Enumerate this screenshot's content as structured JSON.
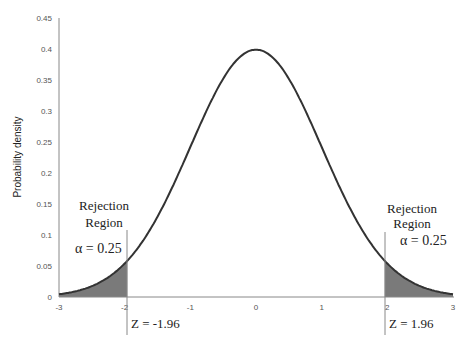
{
  "chart_data": {
    "type": "area",
    "title": "",
    "xlabel": "",
    "ylabel": "Probability density",
    "xlim": [
      -3,
      3
    ],
    "ylim": [
      0,
      0.45
    ],
    "x_ticks": [
      "-3",
      "-2",
      "-1",
      "0",
      "1",
      "2",
      "3"
    ],
    "y_ticks": [
      "0",
      "0.05",
      "0.1",
      "0.15",
      "0.2",
      "0.25",
      "0.3",
      "0.35",
      "0.4",
      "0.45"
    ],
    "grid": false,
    "legend": null,
    "series": [
      {
        "name": "Standard normal density",
        "x": [
          -3,
          -2.5,
          -2,
          -1.96,
          -1.5,
          -1,
          -0.5,
          0,
          0.5,
          1,
          1.5,
          1.96,
          2,
          2.5,
          3
        ],
        "values": [
          0.004,
          0.018,
          0.054,
          0.058,
          0.13,
          0.242,
          0.352,
          0.399,
          0.352,
          0.242,
          0.13,
          0.058,
          0.054,
          0.018,
          0.004
        ]
      }
    ],
    "shaded_regions": [
      {
        "from": -3,
        "to": -1.96,
        "color": "#7a7a7a"
      },
      {
        "from": 1.96,
        "to": 3,
        "color": "#7a7a7a"
      }
    ],
    "annotations": {
      "left_region_title_1": "Rejection",
      "left_region_title_2": "Region",
      "left_alpha": "α = 0.25",
      "right_region_title_1": "Rejection",
      "right_region_title_2": "Region",
      "right_alpha": "α = 0.25",
      "left_critical": "Z = -1.96",
      "right_critical": "Z = 1.96"
    },
    "colors": {
      "curve": "#333333",
      "shade": "#7a7a7a",
      "axis": "#888888"
    }
  }
}
